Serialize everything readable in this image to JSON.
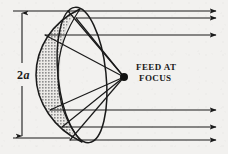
{
  "figure": {
    "background_color": "#f2f1ef",
    "ink_color": "#1a1a1a",
    "shading_color": "#9a9a9a",
    "labels": {
      "feed_line1": "FEED AT",
      "feed_line2": "FOCUS",
      "diameter_prefix": "2",
      "diameter_symbol": "a"
    },
    "focus_point": {
      "x": 124,
      "y": 77,
      "radius": 4
    },
    "dimension_line": {
      "name": "aperture-diameter",
      "x": 22,
      "y_top": 11,
      "y_bottom": 138,
      "extension_top_x1": 22,
      "extension_top_x2": 70,
      "extension_bottom_x1": 22,
      "extension_bottom_x2": 70,
      "value_text": "2a"
    },
    "rim_ellipse": {
      "center_x": 82,
      "center_y": 75,
      "radius_x": 24,
      "radius_y": 68,
      "rotation_deg": -6
    },
    "dish_outline": {
      "apex_x": 36,
      "apex_y": 75,
      "top_x": 80,
      "top_y": 9,
      "bottom_x": 82,
      "bottom_y": 142
    },
    "incoming_rays": [
      {
        "id": 1,
        "y": 11,
        "x_start": 68,
        "x_end": 222,
        "arrow": true
      },
      {
        "id": 2,
        "y": 18,
        "x_start": 76,
        "x_end": 222,
        "arrow": true
      },
      {
        "id": 3,
        "y": 35,
        "x_start": 45,
        "x_end": 222,
        "arrow": true
      },
      {
        "id": 4,
        "y": 110,
        "x_start": 50,
        "x_end": 222,
        "arrow": true
      },
      {
        "id": 5,
        "y": 127,
        "x_start": 62,
        "x_end": 222,
        "arrow": true
      },
      {
        "id": 6,
        "y": 140,
        "x_start": 70,
        "x_end": 222,
        "arrow": true
      }
    ],
    "reflected_rays": [
      {
        "id": 1,
        "from_x": 68,
        "from_y": 11,
        "to_x": 124,
        "to_y": 77
      },
      {
        "id": 2,
        "from_x": 76,
        "from_y": 18,
        "to_x": 124,
        "to_y": 77
      },
      {
        "id": 3,
        "from_x": 45,
        "from_y": 35,
        "to_x": 124,
        "to_y": 77
      },
      {
        "id": 4,
        "from_x": 50,
        "from_y": 110,
        "to_x": 124,
        "to_y": 77
      },
      {
        "id": 5,
        "from_x": 62,
        "from_y": 127,
        "to_x": 124,
        "to_y": 77
      },
      {
        "id": 6,
        "from_x": 70,
        "from_y": 140,
        "to_x": 124,
        "to_y": 77
      }
    ],
    "ray_count_top": 3,
    "ray_count_bottom": 3,
    "ray_count_total": 6
  }
}
